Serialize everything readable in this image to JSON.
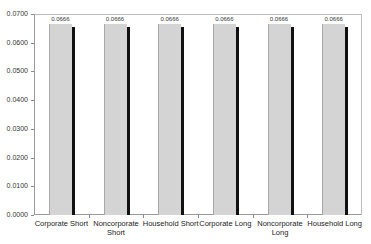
{
  "chart_data": {
    "type": "bar",
    "title": "",
    "xlabel": "",
    "ylabel": "",
    "categories": [
      "Corporate Short",
      "Noncorporate Short",
      "Household Short",
      "Corporate Long",
      "Noncorporate Long",
      "Household Long"
    ],
    "category_lines": [
      [
        "Corporate Short"
      ],
      [
        "Noncorporate",
        "Short"
      ],
      [
        "Household Short"
      ],
      [
        "Corporate Long"
      ],
      [
        "Noncorporate",
        "Long"
      ],
      [
        "Household Long"
      ]
    ],
    "values": [
      0.0666,
      0.0666,
      0.0666,
      0.0666,
      0.0666,
      0.0666
    ],
    "data_labels": [
      "0.0666",
      "0.0666",
      "0.0666",
      "0.0666",
      "0.0666",
      "0.0666"
    ],
    "ylim": [
      0,
      0.07
    ],
    "yticks": [
      "0.0000",
      "0.0100",
      "0.0200",
      "0.0300",
      "0.0400",
      "0.0500",
      "0.0600",
      "0.0700"
    ],
    "grid": false,
    "legend": null,
    "bar_color": "#d4d4d4",
    "shadow_color": "#111111"
  }
}
